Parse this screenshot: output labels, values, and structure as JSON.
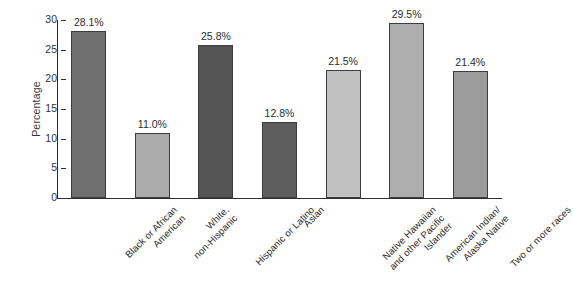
{
  "chart_data": {
    "type": "bar",
    "title": "",
    "xlabel": "",
    "ylabel": "Percentage",
    "ylim": [
      0,
      30
    ],
    "ytick_step": 5,
    "grid": false,
    "legend": "none",
    "categories": [
      "Black or African\nAmerican",
      "White,\nnon-Hispanic",
      "Hispanic or Latino",
      "Asian",
      "Native Hawaiian\nand other Pacific\nIslander",
      "American Indian/\nAlaska Native",
      "Two or more races"
    ],
    "values": [
      28.1,
      11.0,
      25.8,
      12.8,
      21.5,
      29.5,
      21.4
    ],
    "value_labels": [
      "28.1%",
      "11.0%",
      "25.8%",
      "12.8%",
      "21.5%",
      "29.5%",
      "21.4%"
    ],
    "bar_colors": [
      "#6f6f6f",
      "#ababab",
      "#545454",
      "#5e5e5e",
      "#c0c0c0",
      "#aeaeae",
      "#9c9c9c"
    ],
    "bar_border_color": "#3d3d3d",
    "axis_color": "#2e2e2e",
    "ytick_labels": [
      "0",
      "5",
      "10",
      "15",
      "20",
      "25",
      "30"
    ],
    "ytick_values": [
      0,
      5,
      10,
      15,
      20,
      25,
      30
    ]
  },
  "caption": {
    "text": ""
  }
}
